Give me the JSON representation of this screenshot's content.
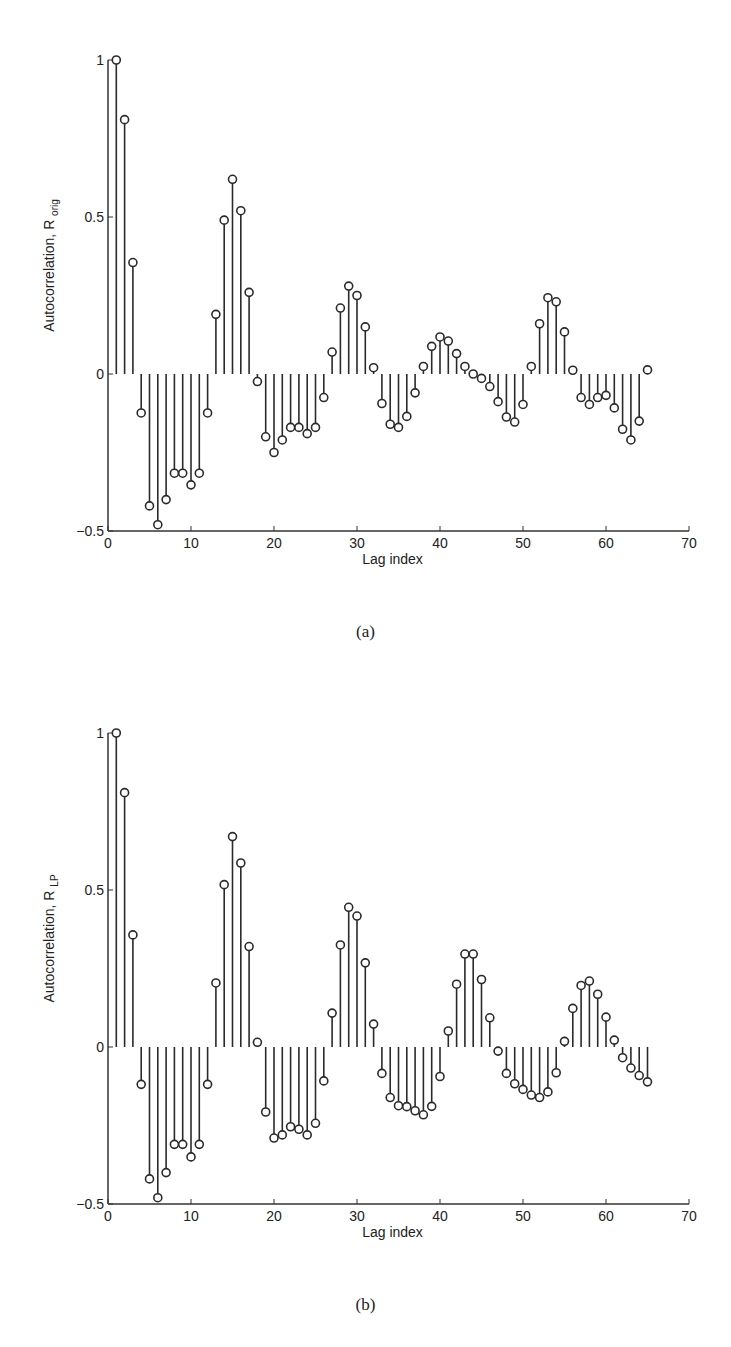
{
  "chart_data": [
    {
      "type": "stem",
      "panel": "(a)",
      "caption": "(a)",
      "xlabel": "Lag index",
      "ylabel": "Autocorrelation, R",
      "ylabel_subscript": "orig",
      "xlim": [
        0,
        70
      ],
      "ylim": [
        -0.5,
        1
      ],
      "xticks": [
        0,
        10,
        20,
        30,
        40,
        50,
        60,
        70
      ],
      "yticks": [
        -0.5,
        0,
        0.5,
        1
      ],
      "ytick_labels": [
        "−0.5",
        "0",
        "0.5",
        "1"
      ],
      "grid": false,
      "x": [
        1,
        2,
        3,
        4,
        5,
        6,
        7,
        8,
        9,
        10,
        11,
        12,
        13,
        14,
        15,
        16,
        17,
        18,
        19,
        20,
        21,
        22,
        23,
        24,
        25,
        26,
        27,
        28,
        29,
        30,
        31,
        32,
        33,
        34,
        35,
        36,
        37,
        38,
        39,
        40,
        41,
        42,
        43,
        44,
        45,
        46,
        47,
        48,
        49,
        50,
        51,
        52,
        53,
        54,
        55,
        56,
        57,
        58,
        59,
        60,
        61,
        62,
        63,
        64,
        65
      ],
      "values": [
        1.0,
        0.81,
        0.355,
        -0.124,
        -0.42,
        -0.48,
        -0.4,
        -0.316,
        -0.316,
        -0.353,
        -0.316,
        -0.124,
        0.19,
        0.49,
        0.62,
        0.52,
        0.26,
        -0.024,
        -0.2,
        -0.25,
        -0.21,
        -0.17,
        -0.17,
        -0.19,
        -0.17,
        -0.075,
        0.07,
        0.21,
        0.28,
        0.25,
        0.15,
        0.02,
        -0.094,
        -0.16,
        -0.17,
        -0.135,
        -0.06,
        0.024,
        0.088,
        0.118,
        0.105,
        0.065,
        0.024,
        0.0,
        -0.014,
        -0.04,
        -0.088,
        -0.137,
        -0.153,
        -0.097,
        0.024,
        0.16,
        0.243,
        0.23,
        0.134,
        0.012,
        -0.075,
        -0.097,
        -0.075,
        -0.068,
        -0.108,
        -0.176,
        -0.21,
        -0.15,
        0.013
      ]
    },
    {
      "type": "stem",
      "panel": "(b)",
      "caption": "(b)",
      "xlabel": "Lag index",
      "ylabel": "Autocorrelation, R",
      "ylabel_subscript": "LP",
      "xlim": [
        0,
        70
      ],
      "ylim": [
        -0.5,
        1
      ],
      "xticks": [
        0,
        10,
        20,
        30,
        40,
        50,
        60,
        70
      ],
      "yticks": [
        -0.5,
        0,
        0.5,
        1
      ],
      "ytick_labels": [
        "−0.5",
        "0",
        "0.5",
        "1"
      ],
      "grid": false,
      "x": [
        1,
        2,
        3,
        4,
        5,
        6,
        7,
        8,
        9,
        10,
        11,
        12,
        13,
        14,
        15,
        16,
        17,
        18,
        19,
        20,
        21,
        22,
        23,
        24,
        25,
        26,
        27,
        28,
        29,
        30,
        31,
        32,
        33,
        34,
        35,
        36,
        37,
        38,
        39,
        40,
        41,
        42,
        43,
        44,
        45,
        46,
        47,
        48,
        49,
        50,
        51,
        52,
        53,
        54,
        55,
        56,
        57,
        58,
        59,
        60,
        61,
        62,
        63,
        64,
        65
      ],
      "values": [
        1.0,
        0.81,
        0.357,
        -0.119,
        -0.42,
        -0.48,
        -0.4,
        -0.31,
        -0.31,
        -0.35,
        -0.31,
        -0.119,
        0.204,
        0.517,
        0.67,
        0.586,
        0.32,
        0.015,
        -0.207,
        -0.29,
        -0.28,
        -0.254,
        -0.262,
        -0.28,
        -0.243,
        -0.108,
        0.108,
        0.325,
        0.445,
        0.417,
        0.268,
        0.073,
        -0.084,
        -0.161,
        -0.187,
        -0.19,
        -0.203,
        -0.216,
        -0.189,
        -0.094,
        0.051,
        0.2,
        0.296,
        0.296,
        0.215,
        0.093,
        -0.013,
        -0.084,
        -0.117,
        -0.135,
        -0.153,
        -0.161,
        -0.143,
        -0.082,
        0.018,
        0.123,
        0.196,
        0.21,
        0.168,
        0.095,
        0.022,
        -0.034,
        -0.067,
        -0.091,
        -0.111
      ]
    }
  ],
  "colors": {
    "stem": "#2a2a2a",
    "axis": "#333333",
    "background": "#ffffff"
  }
}
